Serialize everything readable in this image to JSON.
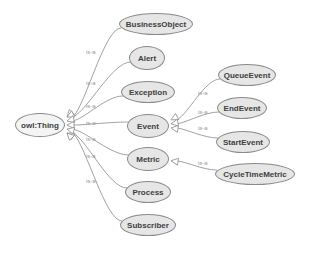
{
  "diagram": {
    "type": "ontology class hierarchy",
    "edge_label": "is-a",
    "colors": {
      "node_fill": "#e6e6e6",
      "node_border": "#8a8a8a",
      "edge": "#8a8a8a",
      "label": "#9a9a9a"
    },
    "nodes": [
      {
        "id": "thing",
        "label": "owl:Thing",
        "x": 40,
        "y": 125,
        "w": 50,
        "h": 24
      },
      {
        "id": "businessobject",
        "label": "BusinessObject",
        "x": 156,
        "y": 24,
        "w": 74,
        "h": 22
      },
      {
        "id": "alert",
        "label": "Alert",
        "x": 147,
        "y": 58,
        "w": 36,
        "h": 24
      },
      {
        "id": "exception",
        "label": "Exception",
        "x": 148,
        "y": 92,
        "w": 54,
        "h": 22
      },
      {
        "id": "event",
        "label": "Event",
        "x": 148,
        "y": 126,
        "w": 42,
        "h": 24
      },
      {
        "id": "metric",
        "label": "Metric",
        "x": 148,
        "y": 159,
        "w": 42,
        "h": 24
      },
      {
        "id": "process",
        "label": "Process",
        "x": 148,
        "y": 192,
        "w": 46,
        "h": 22
      },
      {
        "id": "subscriber",
        "label": "Subscriber",
        "x": 148,
        "y": 225,
        "w": 56,
        "h": 22
      },
      {
        "id": "queueevent",
        "label": "QueueEvent",
        "x": 247,
        "y": 75,
        "w": 58,
        "h": 22
      },
      {
        "id": "endevent",
        "label": "EndEvent",
        "x": 242,
        "y": 108,
        "w": 50,
        "h": 22
      },
      {
        "id": "startevent",
        "label": "StartEvent",
        "x": 243,
        "y": 142,
        "w": 54,
        "h": 22
      },
      {
        "id": "cycletimemetric",
        "label": "CycleTimeMetric",
        "x": 255,
        "y": 174,
        "w": 80,
        "h": 22
      }
    ],
    "edges": [
      {
        "from": "businessobject",
        "to": "thing",
        "label": "is-a",
        "lx": 86,
        "ly": 53
      },
      {
        "from": "alert",
        "to": "thing",
        "label": "is-a",
        "lx": 86,
        "ly": 84
      },
      {
        "from": "exception",
        "to": "thing",
        "label": "is-a",
        "lx": 86,
        "ly": 107
      },
      {
        "from": "event",
        "to": "thing",
        "label": "is-a",
        "lx": 86,
        "ly": 124
      },
      {
        "from": "metric",
        "to": "thing",
        "label": "is-a",
        "lx": 86,
        "ly": 140
      },
      {
        "from": "process",
        "to": "thing",
        "label": "is-a",
        "lx": 86,
        "ly": 157
      },
      {
        "from": "subscriber",
        "to": "thing",
        "label": "is-a",
        "lx": 86,
        "ly": 182
      },
      {
        "from": "queueevent",
        "to": "event",
        "label": "is-a",
        "lx": 198,
        "ly": 94
      },
      {
        "from": "endevent",
        "to": "event",
        "label": "is-a",
        "lx": 198,
        "ly": 113
      },
      {
        "from": "startevent",
        "to": "event",
        "label": "is-a",
        "lx": 198,
        "ly": 129
      },
      {
        "from": "cycletimemetric",
        "to": "metric",
        "label": "is-a",
        "lx": 198,
        "ly": 164
      }
    ]
  }
}
